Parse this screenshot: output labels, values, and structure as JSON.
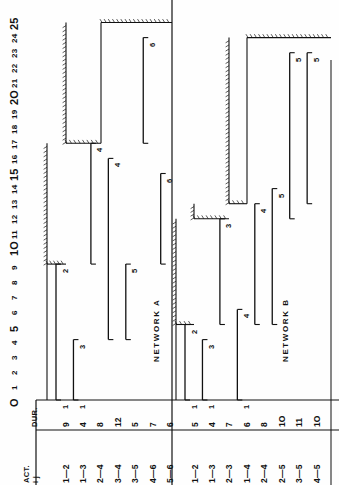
{
  "page": {
    "axis_label_origin": "O"
  },
  "time_axis": {
    "label": "",
    "min": 0,
    "max": 25,
    "ticks": [
      "O",
      "1",
      "2",
      "3",
      "4",
      "5",
      "6",
      "7",
      "8",
      "9",
      "1O",
      "11",
      "12",
      "13",
      "14",
      "15",
      "16",
      "17",
      "18",
      "19",
      "2O",
      "21",
      "22",
      "23",
      "24",
      "25"
    ],
    "unit_px": 15.1,
    "baseline_px": 400
  },
  "table": {
    "header_act": "ACT.",
    "header_ij": "i  j",
    "header_dur": "DUR."
  },
  "networks": [
    {
      "name": "NETWORK A",
      "label": "NETWORK  A",
      "project_duration": 25,
      "rows": [
        {
          "act": "1—2",
          "dur": "9",
          "start": 0,
          "end": 9,
          "node": "2"
        },
        {
          "act": "1—3",
          "dur": "4",
          "start": 0,
          "end": 4,
          "node": "3"
        },
        {
          "act": "2—4",
          "dur": "8",
          "start": 9,
          "end": 17,
          "node": "4"
        },
        {
          "act": "3—4",
          "dur": "12",
          "start": 4,
          "end": 16,
          "node": "4"
        },
        {
          "act": "3—5",
          "dur": "5",
          "start": 4,
          "end": 9,
          "node": "5"
        },
        {
          "act": "4—6",
          "dur": "7",
          "start": 17,
          "end": 24,
          "node": "6"
        },
        {
          "act": "5—6",
          "dur": "6",
          "start": 9,
          "end": 15,
          "node": "6"
        }
      ],
      "staircase": [
        {
          "from": 0,
          "to": 9
        },
        {
          "from": 9,
          "to": 17
        },
        {
          "from": 17,
          "to": 25
        }
      ]
    },
    {
      "name": "NETWORK B",
      "label": "NETWORK  B",
      "project_duration": 24,
      "rows": [
        {
          "act": "1—2",
          "dur": "5",
          "start": 0,
          "end": 5,
          "node": "2"
        },
        {
          "act": "1—3",
          "dur": "4",
          "start": 0,
          "end": 4,
          "node": "3"
        },
        {
          "act": "2—3",
          "dur": "7",
          "start": 5,
          "end": 12,
          "node": "3"
        },
        {
          "act": "1—4",
          "dur": "6",
          "start": 0,
          "end": 6,
          "node": "4"
        },
        {
          "act": "2—4",
          "dur": "8",
          "start": 5,
          "end": 13,
          "node": "4"
        },
        {
          "act": "2—5",
          "dur": "1O",
          "start": 5,
          "end": 14,
          "node": "5"
        },
        {
          "act": "3—5",
          "dur": "11",
          "start": 12,
          "end": 23,
          "node": "5"
        },
        {
          "act": "4—5",
          "dur": "1O",
          "start": 13,
          "end": 23,
          "node": "5"
        }
      ],
      "staircase": [
        {
          "from": 0,
          "to": 5
        },
        {
          "from": 5,
          "to": 12
        },
        {
          "from": 12,
          "to": 13
        },
        {
          "from": 13,
          "to": 24
        }
      ]
    }
  ],
  "chart_data": {
    "type": "bar",
    "xlabel": "Time units",
    "ylabel": "Activity (i—j)",
    "xlim": [
      0,
      25
    ],
    "grid": false,
    "legend": "none",
    "orientation": "horizontal-rotated",
    "series": [
      {
        "name": "NETWORK A",
        "categories": [
          "1—2",
          "1—3",
          "2—4",
          "3—4",
          "3—5",
          "4—6",
          "5—6"
        ],
        "durations": [
          9,
          4,
          8,
          12,
          5,
          7,
          6
        ],
        "starts": [
          0,
          0,
          9,
          4,
          4,
          17,
          9
        ],
        "ends": [
          9,
          4,
          17,
          16,
          9,
          24,
          15
        ],
        "end_nodes": [
          "2",
          "3",
          "4",
          "4",
          "5",
          "6",
          "6"
        ]
      },
      {
        "name": "NETWORK B",
        "categories": [
          "1—2",
          "1—3",
          "2—3",
          "1—4",
          "2—4",
          "2—5",
          "3—5",
          "4—5"
        ],
        "durations": [
          5,
          4,
          7,
          6,
          8,
          10,
          11,
          10
        ],
        "starts": [
          0,
          0,
          5,
          0,
          5,
          5,
          12,
          13
        ],
        "ends": [
          5,
          4,
          12,
          6,
          13,
          14,
          23,
          23
        ],
        "end_nodes": [
          "2",
          "3",
          "3",
          "4",
          "4",
          "5",
          "5",
          "5"
        ]
      }
    ]
  }
}
